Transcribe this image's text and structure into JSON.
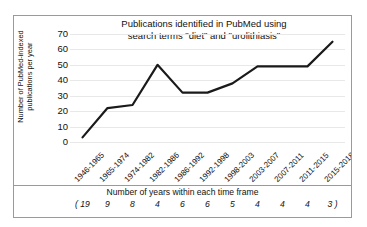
{
  "chart_data": {
    "type": "line",
    "title": "Publications identified in PubMed using search terms \"diet\" and \"urolithiasis\"",
    "title_line1": "Publications identified in PubMed using",
    "title_line2": "search terms \"diet\" and \"urolithiasis\"",
    "xlabel": "",
    "ylabel": "Number of PubMed-indexed publications per year",
    "ylabel_line1": "Number of PubMed-indexed",
    "ylabel_line2": "publications per year",
    "categories": [
      "1946-1965",
      "1965-1974",
      "1974-1982",
      "1982-1986",
      "1986-1992",
      "1992-1998",
      "1998-2003",
      "2003-2007",
      "2007-2011",
      "2011-2015",
      "2015-2018"
    ],
    "values": [
      3,
      22,
      24,
      50,
      32,
      32,
      38,
      49,
      49,
      49,
      65
    ],
    "ylim": [
      0,
      70
    ],
    "yticks": [
      0,
      10,
      20,
      30,
      40,
      50,
      60,
      70
    ],
    "grid": true,
    "legend": "none",
    "series_color": "#1a1a1a"
  },
  "caption": {
    "text": "Number of years within each time frame",
    "open_paren": "( 19",
    "counts": [
      "( 19",
      "9",
      "8",
      "4",
      "6",
      "6",
      "5",
      "4",
      "4",
      "4",
      "3 )"
    ],
    "values_only": [
      19,
      9,
      8,
      4,
      6,
      6,
      5,
      4,
      4,
      4,
      3
    ]
  }
}
